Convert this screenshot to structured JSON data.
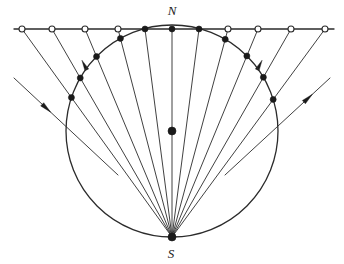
{
  "figure": {
    "title_visible": false,
    "labels": {
      "north_pole": "N",
      "south_pole": "S"
    },
    "colors": {
      "stroke": "#2b2b2b",
      "fill_dot": "#1a1a1a",
      "open_dot_fill": "#ffffff",
      "background": "#ffffff"
    },
    "geometry": {
      "circle_center_x": 172,
      "circle_center_y": 131,
      "circle_radius": 106,
      "north_point_x": 172,
      "north_point_y": 25,
      "south_point_x": 172,
      "south_point_y": 237,
      "tangent_line_y": 29,
      "tangent_line_x1": 14,
      "tangent_line_x2": 334
    },
    "tangent_line_marks": [
      {
        "x": 22,
        "type": "open"
      },
      {
        "x": 52,
        "type": "open"
      },
      {
        "x": 85,
        "type": "open"
      },
      {
        "x": 118,
        "type": "open"
      },
      {
        "x": 145,
        "type": "filled"
      },
      {
        "x": 172,
        "type": "filled"
      },
      {
        "x": 199,
        "type": "filled"
      },
      {
        "x": 228,
        "type": "open"
      },
      {
        "x": 258,
        "type": "open"
      },
      {
        "x": 291,
        "type": "open"
      },
      {
        "x": 325,
        "type": "open"
      }
    ],
    "rays_from_south_pole": [
      {
        "target_x": 22,
        "has_circle_dot": true
      },
      {
        "target_x": 52,
        "has_circle_dot": true
      },
      {
        "target_x": 85,
        "has_circle_dot": true
      },
      {
        "target_x": 118,
        "has_circle_dot": true
      },
      {
        "target_x": 145,
        "has_circle_dot": true
      },
      {
        "target_x": 172,
        "has_circle_dot": false
      },
      {
        "target_x": 199,
        "has_circle_dot": true
      },
      {
        "target_x": 228,
        "has_circle_dot": true
      },
      {
        "target_x": 258,
        "has_circle_dot": true
      },
      {
        "target_x": 291,
        "has_circle_dot": true
      },
      {
        "target_x": 325,
        "has_circle_dot": true
      }
    ],
    "external_rays": [
      {
        "name": "left-incoming-ray",
        "x1": 14,
        "y1": 78,
        "x2": 118,
        "y2": 175,
        "arrow_t": 0.3,
        "direction": "down-right"
      },
      {
        "name": "right-outgoing-ray",
        "x1": 225,
        "y1": 175,
        "x2": 330,
        "y2": 78,
        "arrow_t": 0.78,
        "direction": "up-right"
      }
    ],
    "ray_arrowheads": [
      {
        "on_ray_target_x": 66,
        "t": 0.82,
        "direction": "down-left"
      },
      {
        "on_ray_target_x": 278,
        "t": 0.82,
        "direction": "up-right"
      }
    ],
    "center_dot": {
      "x": 172,
      "y": 131,
      "radius": 4
    }
  }
}
